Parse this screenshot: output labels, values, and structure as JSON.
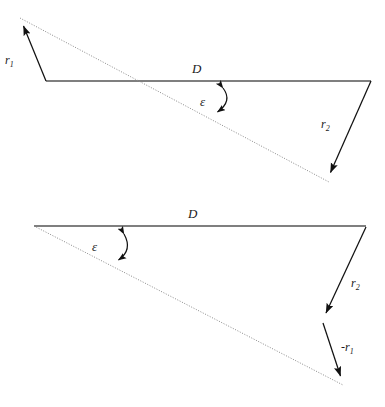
{
  "figure": {
    "background_color": "#ffffff",
    "stroke_color": "#1a1a1a",
    "baseline_color": "#555555",
    "dotted_color": "#7a7a7a",
    "panels": [
      {
        "name": "upper-diagram",
        "labels": {
          "baseline": "D",
          "angle": "ε",
          "vector_left": "r",
          "vector_left_sub": "1",
          "vector_right": "r",
          "vector_right_sub": "2"
        },
        "geometry": {
          "baseline_from": [
            46,
            81
          ],
          "baseline_to": [
            371,
            81
          ],
          "dotted_from": [
            20,
            18
          ],
          "dotted_to": [
            329,
            182
          ],
          "r1_from": [
            46,
            81
          ],
          "r1_to": [
            20,
            18
          ],
          "r2_from": [
            371,
            81
          ],
          "r2_to": [
            329,
            182
          ],
          "arc_from": [
            222,
            84
          ],
          "arc_to": [
            215,
            117
          ]
        }
      },
      {
        "name": "lower-diagram",
        "labels": {
          "baseline": "D",
          "angle": "ε",
          "vector_r2": "r",
          "vector_r2_sub": "2",
          "vector_minus_r1_sign": "-",
          "vector_minus_r1": "r",
          "vector_minus_r1_sub": "1"
        },
        "geometry": {
          "baseline_from": [
            34,
            226
          ],
          "baseline_to": [
            366,
            226
          ],
          "dotted_from": [
            34,
            226
          ],
          "dotted_to": [
            343,
            385
          ],
          "r2_from": [
            366,
            227
          ],
          "r2_to": [
            323,
            321
          ],
          "minus_r1_from": [
            323,
            323
          ],
          "minus_r1_to": [
            343,
            385
          ],
          "arc_from": [
            123,
            230
          ],
          "arc_to": [
            116,
            266
          ]
        }
      }
    ]
  },
  "labels_text": {
    "upper": {
      "D": "D",
      "epsilon": "ε",
      "r1_base": "r",
      "r1_sub": "1",
      "r2_base": "r",
      "r2_sub": "2"
    },
    "lower": {
      "D": "D",
      "epsilon": "ε",
      "r2_base": "r",
      "r2_sub": "2",
      "mr1_sign": "-",
      "mr1_base": "r",
      "mr1_sub": "1"
    }
  }
}
